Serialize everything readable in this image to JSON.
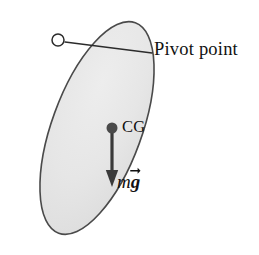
{
  "figure": {
    "type": "physics-free-body-diagram",
    "background_color": "#ffffff"
  },
  "body_shape": {
    "name": "tilted-ellipse",
    "fill_color": "#e4e4e4",
    "outline_color": "#4a4a4a",
    "center_x": 97,
    "center_y": 128,
    "semi_major": 112,
    "semi_minor": 45,
    "rotation_degrees": 20
  },
  "pivot": {
    "label": "Pivot point",
    "marker": "open-circle",
    "marker_fill": "#ffffff",
    "marker_stroke": "#2b2b2b",
    "marker_x": 58,
    "marker_y": 40,
    "marker_radius": 6,
    "leader_line_from_x": 65,
    "leader_line_from_y": 42,
    "leader_line_to_x": 152,
    "leader_line_to_y": 53,
    "leader_color": "#2b2b2b"
  },
  "center_of_gravity": {
    "label": "CG",
    "marker": "filled-circle",
    "marker_color": "#4a4a4a",
    "marker_x": 112,
    "marker_y": 128,
    "marker_radius": 5.5
  },
  "weight_vector": {
    "label_m": "m",
    "label_g": "g",
    "label_full": "mg",
    "vector_notation": "arrow-over-g",
    "direction": "down",
    "color": "#3a3a3a",
    "tail_x": 112,
    "tail_y": 132,
    "tip_x": 112,
    "tip_y": 186,
    "shaft_width": 3.2,
    "head_width": 11,
    "head_length": 15
  },
  "colors": {
    "ink": "#111111",
    "shape_fill": "#e4e4e4",
    "shape_outline": "#4a4a4a",
    "arrow": "#3a3a3a"
  }
}
